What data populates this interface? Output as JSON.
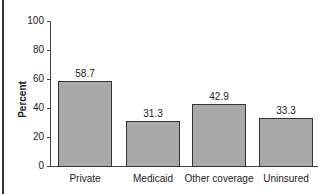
{
  "chart_data": {
    "type": "bar",
    "title": "",
    "xlabel": "",
    "ylabel": "Percent",
    "ylim": [
      0,
      100
    ],
    "yticks": [
      0,
      20,
      40,
      60,
      80,
      100
    ],
    "categories": [
      "Private",
      "Medicaid",
      "Other coverage",
      "Uninsured"
    ],
    "values": [
      58.7,
      31.3,
      42.9,
      33.3
    ],
    "value_labels": [
      "58.7",
      "31.3",
      "42.9",
      "33.3"
    ],
    "grid": false,
    "legend": null,
    "bar_color": "#a9a9a9"
  }
}
